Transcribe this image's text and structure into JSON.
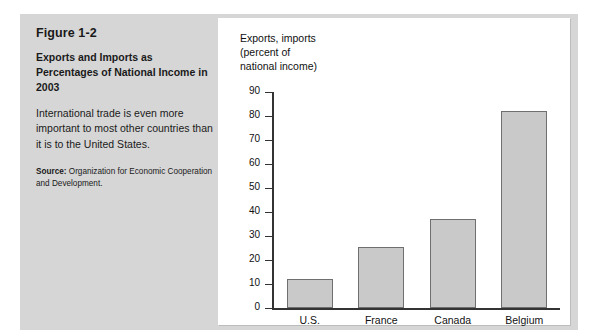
{
  "figure": {
    "number": "Figure 1-2",
    "title": "Exports and Imports as Percentages of National Income in 2003",
    "description": "International trade is even more important to most other countries than it is to the United States.",
    "source_label": "Source:",
    "source_text": " Organization for Economic Cooperation and Development."
  },
  "colors": {
    "panel_background": "#d6d6d6",
    "chart_background": "#ffffff",
    "bar_fill": "#c9c9c9",
    "bar_stroke": "#6f6f6f",
    "axis": "#333333",
    "text": "#111111"
  },
  "chart_data": {
    "type": "bar",
    "title": "",
    "ylabel": "Exports, imports\n(percent of\nnational income)",
    "xlabel": "",
    "categories": [
      "U.S.",
      "France",
      "Canada",
      "Belgium"
    ],
    "values": [
      12,
      25.5,
      37,
      82
    ],
    "ylim": [
      0,
      90
    ],
    "yticks": [
      0,
      10,
      20,
      30,
      40,
      50,
      60,
      70,
      80,
      90
    ],
    "ytick_labels": [
      "0",
      "10",
      "20",
      "30",
      "40",
      "50",
      "60",
      "70",
      "80",
      "90"
    ],
    "grid": false,
    "legend": null
  }
}
